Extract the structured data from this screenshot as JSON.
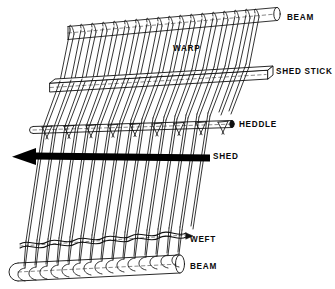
{
  "diagram": {
    "type": "technical-line-drawing",
    "background_color": "#ffffff",
    "line_color": "#111111",
    "fill_color": "#ffffff",
    "solid_color": "#000000",
    "labels": [
      {
        "id": "beam-top",
        "text": "BEAM",
        "x": 287,
        "y": 18,
        "anchor": "start"
      },
      {
        "id": "warp",
        "text": "WARP",
        "x": 173,
        "y": 49,
        "anchor": "start"
      },
      {
        "id": "shed-stick",
        "text": "SHED STICK",
        "x": 276,
        "y": 72,
        "anchor": "start"
      },
      {
        "id": "heddle",
        "text": "HEDDLE",
        "x": 239,
        "y": 125,
        "anchor": "start"
      },
      {
        "id": "shed",
        "text": "SHED",
        "x": 213,
        "y": 157,
        "anchor": "start"
      },
      {
        "id": "weft",
        "text": "WEFT",
        "x": 190,
        "y": 240,
        "anchor": "start"
      },
      {
        "id": "beam-bottom",
        "text": "BEAM",
        "x": 190,
        "y": 267,
        "anchor": "start"
      }
    ],
    "parts": {
      "top_beam": {
        "name": "BEAM",
        "shape": "cylinder",
        "x1": 68,
        "y1": 33,
        "x2": 277,
        "y2": 14,
        "radius": 6.5,
        "wrap_threads": 20
      },
      "shed_stick": {
        "name": "SHED STICK",
        "shape": "flat-bar",
        "x1": 50,
        "y1": 83,
        "x2": 268,
        "y2": 70,
        "thickness": 9,
        "depth": 5
      },
      "heddle_rod": {
        "name": "HEDDLE",
        "shape": "rod",
        "x1": 33,
        "y1": 130,
        "x2": 232,
        "y2": 124,
        "radius": 3.5,
        "loops": 10
      },
      "shed_arrow": {
        "name": "SHED",
        "shape": "arrow",
        "x1": 210,
        "y1": 158,
        "x2": 12,
        "y2": 156,
        "thickness": 7,
        "direction": "left"
      },
      "weft_row": {
        "name": "WEFT",
        "shape": "interlace",
        "x1": 20,
        "y1": 243,
        "x2": 186,
        "y2": 236,
        "picks": 17
      },
      "bottom_beam": {
        "name": "BEAM",
        "shape": "cylinder",
        "x1": 18,
        "y1": 272,
        "x2": 180,
        "y2": 264,
        "radius": 9,
        "wrap_threads": 20
      },
      "warp_threads": {
        "name": "WARP",
        "shape": "diagonal-threads",
        "count": 20,
        "slant": "right-leaning"
      }
    }
  }
}
